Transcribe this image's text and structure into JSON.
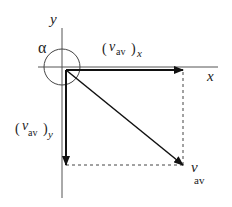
{
  "diagram": {
    "type": "vector-decomposition",
    "axes": {
      "x_label": "x",
      "y_label": "y"
    },
    "angle": {
      "symbol": "α"
    },
    "vectors": [
      {
        "name": "v_av_x",
        "base": "v",
        "sub": "av",
        "outer_sub": "x",
        "direction": "right"
      },
      {
        "name": "v_av_y",
        "base": "v",
        "sub": "av",
        "outer_sub": "y",
        "direction": "down"
      },
      {
        "name": "v_av",
        "base": "v",
        "sub": "av",
        "direction": "down-right"
      }
    ],
    "labels": {
      "vx_base": "v",
      "vx_sub": "av",
      "vx_outer": "x",
      "vy_base": "v",
      "vy_sub": "av",
      "vy_outer": "y",
      "v_base": "v",
      "v_sub": "av",
      "open_paren": "(",
      "close_paren": ")"
    },
    "colors": {
      "line": "#222222",
      "axis": "#555555",
      "dashed": "#444444"
    }
  }
}
